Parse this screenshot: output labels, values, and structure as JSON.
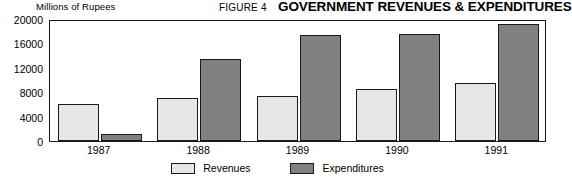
{
  "header": {
    "figure_number": "FIGURE 4",
    "title": "GOVERNMENT REVENUES & EXPENDITURES",
    "unit_label": "Millions of Rupees"
  },
  "colors": {
    "revenues": "#e6e6e6",
    "expenditures": "#808080",
    "outline": "#1a1a1a",
    "background": "#ffffff"
  },
  "chart_data": {
    "type": "bar",
    "title": "GOVERNMENT REVENUES & EXPENDITURES",
    "subtitle": "FIGURE 4",
    "xlabel": "",
    "ylabel": "Millions of Rupees",
    "categories": [
      "1987",
      "1988",
      "1989",
      "1990",
      "1991"
    ],
    "series": [
      {
        "name": "Revenues",
        "color": "#e6e6e6",
        "values": [
          6000,
          7000,
          7300,
          8500,
          9500
        ]
      },
      {
        "name": "Expenditures",
        "color": "#808080",
        "values": [
          1100,
          13500,
          17300,
          17500,
          19200
        ]
      }
    ],
    "ylim": [
      0,
      20000
    ],
    "yticks": [
      0,
      4000,
      8000,
      12000,
      16000,
      20000
    ],
    "ytick_labels": [
      "0",
      "4000",
      "8000",
      "12000",
      "16000",
      "20000"
    ],
    "grid": false,
    "legend_position": "bottom-center",
    "bar_group_layout": "grouped"
  }
}
